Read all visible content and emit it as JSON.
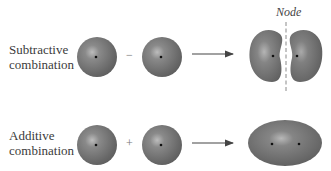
{
  "diagram": {
    "node_label": "Node",
    "rows": [
      {
        "id": "subtractive",
        "label_line1": "Subtractive",
        "label_line2": "combination",
        "operator": "−",
        "result": "two lobes separated by a node"
      },
      {
        "id": "additive",
        "label_line1": "Additive",
        "label_line2": "combination",
        "operator": "+",
        "result": "single elongated ellipsoid"
      }
    ],
    "colors": {
      "orbital_fill": "#6e6e6e",
      "orbital_highlight": "#b8b8b8",
      "nucleus": "#111111",
      "arrow": "#444444",
      "node_line": "#888888"
    }
  }
}
